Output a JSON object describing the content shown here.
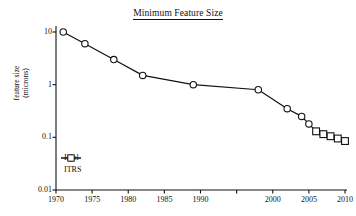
{
  "chart_data": {
    "type": "line",
    "title": "Minimum Feature Size",
    "xlabel": "",
    "ylabel": "feature size\n(microns)",
    "xlim": [
      1970,
      2010
    ],
    "ylim": [
      0.01,
      10
    ],
    "yscale": "log",
    "grid": false,
    "legend_position": "lower left",
    "xticks": [
      1970,
      1975,
      1980,
      1985,
      1990,
      1995,
      2000,
      2005,
      2010
    ],
    "xtick_labels": [
      "1970",
      "1975",
      "1980",
      "1985",
      "1990",
      "",
      "2000",
      "2005",
      "2010"
    ],
    "yticks": [
      10,
      1,
      0.1,
      0.01
    ],
    "ytick_labels": [
      "10",
      "1",
      "0.1",
      "0.01"
    ],
    "series": [
      {
        "name": "Intel",
        "marker": "circle",
        "x": [
          1971,
          1974,
          1978,
          1982,
          1989,
          1998,
          2002,
          2004,
          2005
        ],
        "values": [
          10,
          6,
          3,
          1.5,
          1.0,
          0.8,
          0.35,
          0.25,
          0.18
        ]
      },
      {
        "name": "ITRS",
        "marker": "square",
        "x": [
          2006,
          2007,
          2008,
          2009,
          2010
        ],
        "values": [
          0.13,
          0.115,
          0.105,
          0.095,
          0.085
        ]
      }
    ]
  },
  "legend": {
    "items": [
      {
        "label": "Intel",
        "marker": "circle"
      },
      {
        "label": "ITRS",
        "marker": "square"
      }
    ]
  },
  "axes": {
    "y_axis_title_line1": "feature size",
    "y_axis_title_line2": "(microns)"
  },
  "colors": {
    "line": "#111111",
    "marker_face": "#ffffff",
    "axis": "#111111",
    "background": "#ffffff"
  }
}
